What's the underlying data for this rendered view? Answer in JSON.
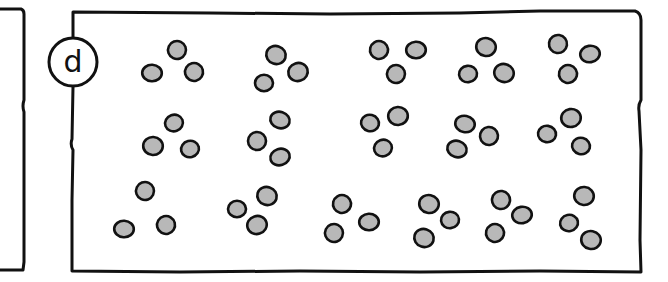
{
  "figure": {
    "panel_label": "d",
    "colors": {
      "background": "#ffffff",
      "stroke": "#111111",
      "dot_fill": "#b8b8b8"
    },
    "dot_radius": 9,
    "rows": [
      {
        "groups": [
          [
            [
              177,
              50
            ],
            [
              152,
              73
            ],
            [
              194,
              72
            ]
          ],
          [
            [
              276,
              55
            ],
            [
              264,
              83
            ],
            [
              298,
              72
            ]
          ],
          [
            [
              379,
              50
            ],
            [
              416,
              50
            ],
            [
              396,
              74
            ]
          ],
          [
            [
              486,
              47
            ],
            [
              468,
              74
            ],
            [
              504,
              73
            ]
          ],
          [
            [
              558,
              44
            ],
            [
              590,
              54
            ],
            [
              568,
              74
            ]
          ]
        ]
      },
      {
        "groups": [
          [
            [
              174,
              123
            ],
            [
              153,
              146
            ],
            [
              190,
              149
            ]
          ],
          [
            [
              280,
              120
            ],
            [
              257,
              141
            ],
            [
              280,
              157
            ]
          ],
          [
            [
              370,
              123
            ],
            [
              398,
              116
            ],
            [
              383,
              148
            ]
          ],
          [
            [
              465,
              124
            ],
            [
              489,
              136
            ],
            [
              457,
              149
            ]
          ],
          [
            [
              547,
              134
            ],
            [
              571,
              118
            ],
            [
              581,
              146
            ]
          ]
        ]
      },
      {
        "groups": [
          [
            [
              145,
              191
            ],
            [
              124,
              229
            ],
            [
              166,
              225
            ]
          ],
          [
            [
              267,
              196
            ],
            [
              237,
              209
            ],
            [
              257,
              225
            ]
          ],
          [
            [
              342,
              204
            ],
            [
              369,
              222
            ],
            [
              334,
              233
            ]
          ],
          [
            [
              429,
              204
            ],
            [
              450,
              220
            ],
            [
              424,
              238
            ]
          ],
          [
            [
              501,
              200
            ],
            [
              522,
              215
            ],
            [
              495,
              233
            ]
          ],
          [
            [
              584,
              196
            ],
            [
              569,
              223
            ],
            [
              591,
              240
            ]
          ]
        ]
      }
    ],
    "group_count": 16,
    "dots_per_group": 3
  }
}
